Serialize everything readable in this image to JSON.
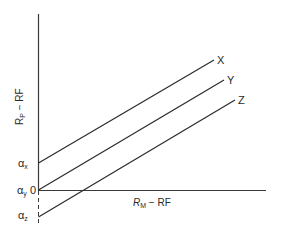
{
  "diagram": {
    "y_axis_label_main": "R",
    "y_axis_label_sub": "P",
    "y_axis_label_rest": " − RF",
    "x_axis_label_main": "R",
    "x_axis_label_sub": "M",
    "x_axis_label_rest": " − RF",
    "intercepts": {
      "alpha_x": {
        "symbol": "α",
        "sub": "x"
      },
      "alpha_y": {
        "symbol": "α",
        "sub": "y",
        "extra": " 0"
      },
      "alpha_z": {
        "symbol": "α",
        "sub": "z"
      }
    },
    "lines": [
      {
        "name": "X",
        "label": "X"
      },
      {
        "name": "Y",
        "label": "Y"
      },
      {
        "name": "Z",
        "label": "Z"
      }
    ],
    "colors": {
      "line": "#2a2a2a",
      "axis": "#3a3a3a"
    }
  }
}
